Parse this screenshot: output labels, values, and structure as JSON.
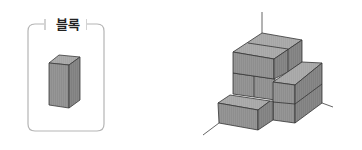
{
  "legend_box": {
    "label": "블록",
    "shape": "rectangular-prism-block"
  },
  "figure": {
    "colors": {
      "face_front": "#8e8e8e",
      "face_top": "#a8a8a8",
      "face_side": "#7e7e7e",
      "edge": "#3a3a3a",
      "frame": "#b8b8b8"
    }
  }
}
